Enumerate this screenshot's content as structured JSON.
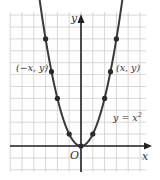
{
  "chart_data": {
    "type": "line",
    "title": "",
    "function": "y = x^2",
    "xlabel": "x",
    "ylabel": "y",
    "origin_label": "O",
    "curve_label": "y = x²",
    "grid": true,
    "xlim": [
      -6,
      6
    ],
    "ylim": [
      -2,
      11
    ],
    "series": [
      {
        "name": "y = x^2",
        "x": [
          -3,
          -2.5,
          -2,
          -1,
          0,
          1,
          2,
          2.5,
          3
        ],
        "y": [
          9,
          6.25,
          4,
          1,
          0,
          1,
          4,
          6.25,
          9
        ]
      }
    ],
    "annotations": [
      {
        "text": "(−x, y)",
        "at": [
          -2.5,
          6.25
        ]
      },
      {
        "text": "(x, y)",
        "at": [
          2.5,
          6.25
        ]
      }
    ]
  },
  "labels": {
    "y_axis": "y",
    "x_axis": "x",
    "origin": "O",
    "left_point": "(−x, y)",
    "right_point": "(x, y)",
    "equation": "y = x",
    "equation_exp": "2"
  },
  "colors": {
    "grid": "#d4d4d4",
    "axis": "#222222",
    "curve": "#3a3a3a",
    "points": "#2a2a2a",
    "text": "#333333"
  }
}
